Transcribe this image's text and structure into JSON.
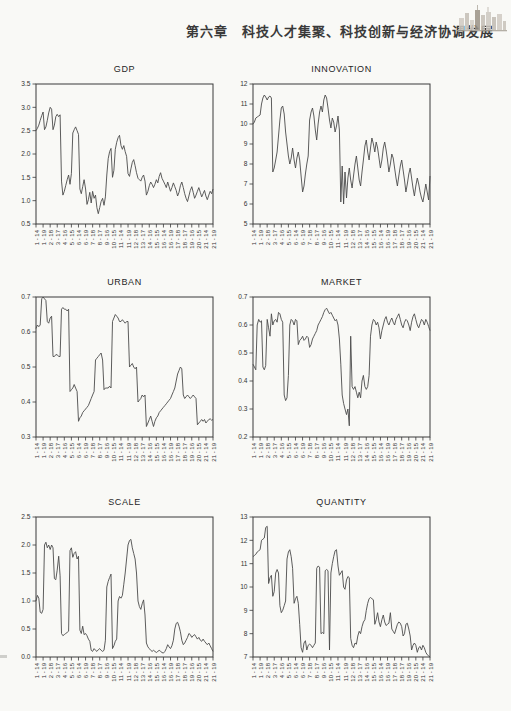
{
  "page": {
    "background": "#f9f9f6",
    "ink": "#4b4b4b"
  },
  "header": {
    "chapter_title": "第六章　科技人才集聚、科技创新与经济协调发展",
    "logo_icon": "city-skyline-icon"
  },
  "chart_data": {
    "type": "line",
    "layout": "2-column 3-row grid of panel-series line charts",
    "grid": "off",
    "legend": "none",
    "x_axis": {
      "n_obs": 126,
      "structure": "21 cross-sections x 6 years (2014-2019), label every 5th observation",
      "labels": [
        "1 - 14",
        "1 - 19",
        "2 - 18",
        "3 - 17",
        "4 - 16",
        "5 - 15",
        "6 - 14",
        "6 - 19",
        "7 - 18",
        "8 - 17",
        "9 - 16",
        "10 - 15",
        "11 - 14",
        "11 - 19",
        "12 - 18",
        "13 - 17",
        "14 - 16",
        "15 - 15",
        "16 - 14",
        "16 - 19",
        "17 - 18",
        "18 - 17",
        "19 - 16",
        "20 - 15",
        "21 - 14",
        "21 - 19"
      ]
    },
    "charts": [
      {
        "title": "GDP",
        "ylim": [
          0.5,
          3.5
        ],
        "ytick_step": 0.5,
        "ytick_decimals": 1,
        "values": [
          2.5,
          2.55,
          2.62,
          2.72,
          2.82,
          2.9,
          2.52,
          2.58,
          2.72,
          2.88,
          3.0,
          2.96,
          2.52,
          2.62,
          2.8,
          2.85,
          2.8,
          2.84,
          1.42,
          1.12,
          1.2,
          1.32,
          1.45,
          1.55,
          1.35,
          1.58,
          2.45,
          2.52,
          2.58,
          2.5,
          2.42,
          1.25,
          1.15,
          1.3,
          1.45,
          1.25,
          0.92,
          1.02,
          1.18,
          0.95,
          1.2,
          1.05,
          1.12,
          0.85,
          0.72,
          0.85,
          0.98,
          1.05,
          0.9,
          1.08,
          1.55,
          1.9,
          2.05,
          2.12,
          1.5,
          1.65,
          2.1,
          2.25,
          2.35,
          2.4,
          2.18,
          2.1,
          2.18,
          2.05,
          1.95,
          1.58,
          1.52,
          1.68,
          1.82,
          1.88,
          1.75,
          1.6,
          1.48,
          1.45,
          1.42,
          1.5,
          1.55,
          1.42,
          1.12,
          1.2,
          1.32,
          1.4,
          1.35,
          1.28,
          1.35,
          1.45,
          1.38,
          1.52,
          1.6,
          1.48,
          1.42,
          1.35,
          1.28,
          1.4,
          1.3,
          1.2,
          1.28,
          1.38,
          1.3,
          1.22,
          1.1,
          1.18,
          1.32,
          1.4,
          1.28,
          1.15,
          1.05,
          0.98,
          1.1,
          1.22,
          1.3,
          1.18,
          1.05,
          1.12,
          1.2,
          1.28,
          1.18,
          1.08,
          1.15,
          1.22,
          1.1,
          1.02,
          1.12,
          1.2,
          1.15,
          1.25
        ]
      },
      {
        "title": "INNOVATION",
        "ylim": [
          5,
          12
        ],
        "ytick_step": 1,
        "ytick_decimals": 0,
        "values": [
          10.0,
          10.1,
          10.3,
          10.35,
          10.4,
          10.45,
          11.0,
          11.3,
          11.45,
          11.35,
          11.2,
          11.35,
          11.4,
          11.3,
          7.6,
          7.8,
          8.2,
          8.6,
          9.4,
          10.2,
          10.8,
          10.9,
          10.5,
          9.6,
          9.0,
          8.4,
          8.0,
          8.3,
          8.8,
          8.2,
          7.8,
          8.3,
          8.6,
          8.2,
          7.4,
          6.6,
          6.9,
          7.5,
          8.0,
          8.4,
          10.2,
          10.6,
          10.8,
          10.4,
          9.7,
          9.2,
          10.0,
          10.6,
          10.9,
          10.6,
          11.2,
          11.45,
          11.3,
          10.8,
          10.2,
          9.8,
          10.3,
          10.1,
          9.6,
          9.9,
          10.4,
          9.7,
          6.1,
          7.9,
          6.0,
          7.6,
          6.3,
          7.3,
          7.8,
          7.2,
          6.8,
          7.4,
          8.0,
          8.4,
          7.8,
          7.2,
          6.9,
          7.6,
          8.2,
          8.9,
          9.2,
          8.6,
          8.2,
          8.8,
          9.3,
          9.0,
          8.6,
          9.1,
          8.8,
          8.3,
          7.8,
          8.2,
          8.8,
          9.1,
          8.7,
          8.2,
          7.6,
          8.0,
          8.5,
          8.3,
          7.8,
          7.3,
          6.9,
          7.4,
          7.9,
          8.2,
          7.7,
          7.2,
          6.6,
          7.0,
          7.5,
          7.8,
          7.3,
          6.8,
          6.4,
          6.9,
          7.3,
          7.0,
          6.6,
          6.3,
          6.1,
          6.5,
          7.0,
          6.6,
          6.2,
          7.4
        ]
      },
      {
        "title": "URBAN",
        "ylim": [
          0.3,
          0.7
        ],
        "ytick_step": 0.1,
        "ytick_decimals": 1,
        "values": [
          0.61,
          0.62,
          0.615,
          0.62,
          0.695,
          0.7,
          0.695,
          0.69,
          0.63,
          0.625,
          0.64,
          0.645,
          0.53,
          0.53,
          0.535,
          0.535,
          0.53,
          0.53,
          0.665,
          0.67,
          0.665,
          0.665,
          0.66,
          0.665,
          0.43,
          0.435,
          0.44,
          0.45,
          0.44,
          0.43,
          0.345,
          0.355,
          0.36,
          0.37,
          0.375,
          0.38,
          0.385,
          0.39,
          0.4,
          0.41,
          0.42,
          0.43,
          0.52,
          0.525,
          0.53,
          0.535,
          0.54,
          0.52,
          0.435,
          0.44,
          0.44,
          0.44,
          0.445,
          0.44,
          0.63,
          0.64,
          0.65,
          0.645,
          0.64,
          0.63,
          0.63,
          0.635,
          0.63,
          0.625,
          0.63,
          0.63,
          0.5,
          0.505,
          0.51,
          0.5,
          0.495,
          0.5,
          0.4,
          0.405,
          0.41,
          0.42,
          0.415,
          0.42,
          0.33,
          0.34,
          0.35,
          0.36,
          0.345,
          0.33,
          0.345,
          0.355,
          0.36,
          0.37,
          0.375,
          0.38,
          0.385,
          0.39,
          0.395,
          0.4,
          0.405,
          0.41,
          0.42,
          0.43,
          0.44,
          0.46,
          0.48,
          0.49,
          0.5,
          0.495,
          0.42,
          0.41,
          0.415,
          0.42,
          0.415,
          0.41,
          0.415,
          0.42,
          0.415,
          0.41,
          0.335,
          0.34,
          0.345,
          0.35,
          0.345,
          0.35,
          0.34,
          0.345,
          0.35,
          0.352,
          0.348,
          0.35
        ]
      },
      {
        "title": "MARKET",
        "ylim": [
          0.2,
          0.7
        ],
        "ytick_step": 0.1,
        "ytick_decimals": 1,
        "values": [
          0.46,
          0.45,
          0.44,
          0.6,
          0.62,
          0.61,
          0.615,
          0.45,
          0.44,
          0.455,
          0.62,
          0.59,
          0.56,
          0.64,
          0.6,
          0.615,
          0.62,
          0.61,
          0.645,
          0.64,
          0.62,
          0.61,
          0.35,
          0.33,
          0.34,
          0.42,
          0.6,
          0.62,
          0.615,
          0.6,
          0.62,
          0.615,
          0.53,
          0.545,
          0.55,
          0.56,
          0.545,
          0.55,
          0.56,
          0.555,
          0.52,
          0.53,
          0.55,
          0.56,
          0.57,
          0.58,
          0.6,
          0.61,
          0.62,
          0.63,
          0.645,
          0.655,
          0.66,
          0.65,
          0.64,
          0.645,
          0.635,
          0.625,
          0.615,
          0.62,
          0.6,
          0.55,
          0.46,
          0.35,
          0.32,
          0.3,
          0.28,
          0.3,
          0.24,
          0.56,
          0.38,
          0.37,
          0.38,
          0.36,
          0.34,
          0.36,
          0.34,
          0.4,
          0.42,
          0.38,
          0.37,
          0.38,
          0.42,
          0.56,
          0.6,
          0.62,
          0.615,
          0.6,
          0.61,
          0.59,
          0.55,
          0.58,
          0.6,
          0.62,
          0.63,
          0.61,
          0.6,
          0.615,
          0.625,
          0.61,
          0.6,
          0.62,
          0.63,
          0.64,
          0.62,
          0.6,
          0.59,
          0.61,
          0.62,
          0.615,
          0.6,
          0.58,
          0.61,
          0.63,
          0.64,
          0.62,
          0.6,
          0.59,
          0.605,
          0.62,
          0.615,
          0.6,
          0.62,
          0.61,
          0.595,
          0.58
        ]
      },
      {
        "title": "SCALE",
        "ylim": [
          0.0,
          2.5
        ],
        "ytick_step": 0.5,
        "ytick_decimals": 1,
        "values": [
          1.0,
          1.1,
          1.05,
          0.8,
          0.78,
          0.85,
          2.0,
          2.05,
          1.95,
          2.0,
          1.92,
          2.0,
          1.95,
          1.4,
          1.38,
          1.55,
          1.8,
          1.45,
          0.42,
          0.38,
          0.4,
          0.42,
          0.44,
          0.46,
          1.9,
          1.95,
          1.78,
          1.85,
          1.88,
          1.75,
          1.8,
          0.48,
          0.42,
          0.55,
          0.4,
          0.42,
          0.38,
          0.32,
          0.28,
          0.12,
          0.1,
          0.15,
          0.12,
          0.1,
          0.13,
          0.15,
          0.12,
          0.1,
          0.12,
          0.3,
          1.25,
          1.35,
          1.42,
          1.48,
          0.15,
          0.2,
          0.28,
          0.32,
          1.0,
          1.08,
          1.05,
          1.1,
          1.3,
          1.5,
          1.75,
          2.0,
          2.08,
          2.1,
          1.95,
          1.85,
          1.75,
          1.5,
          1.0,
          0.9,
          0.85,
          0.95,
          1.02,
          0.75,
          0.25,
          0.18,
          0.15,
          0.12,
          0.1,
          0.12,
          0.1,
          0.08,
          0.1,
          0.12,
          0.1,
          0.08,
          0.07,
          0.1,
          0.15,
          0.22,
          0.18,
          0.15,
          0.2,
          0.3,
          0.5,
          0.6,
          0.62,
          0.55,
          0.45,
          0.3,
          0.22,
          0.25,
          0.3,
          0.35,
          0.42,
          0.4,
          0.35,
          0.38,
          0.4,
          0.36,
          0.32,
          0.35,
          0.3,
          0.28,
          0.32,
          0.28,
          0.25,
          0.22,
          0.25,
          0.2,
          0.15,
          0.1
        ]
      },
      {
        "title": "QUANTITY",
        "ylim": [
          7,
          13
        ],
        "ytick_step": 1,
        "ytick_decimals": 0,
        "values": [
          11.3,
          11.35,
          11.4,
          11.5,
          11.55,
          11.6,
          12.0,
          12.05,
          12.1,
          12.55,
          12.6,
          10.15,
          10.4,
          10.5,
          9.6,
          9.8,
          10.6,
          10.75,
          10.6,
          9.2,
          8.9,
          9.0,
          9.2,
          9.4,
          11.2,
          11.5,
          11.6,
          11.3,
          10.8,
          9.3,
          9.5,
          9.6,
          9.3,
          8.4,
          7.4,
          7.2,
          7.6,
          7.7,
          7.3,
          7.5,
          7.55,
          7.5,
          7.4,
          7.5,
          7.6,
          10.8,
          10.9,
          10.85,
          8.0,
          8.05,
          8.0,
          10.7,
          10.75,
          10.7,
          7.3,
          10.6,
          11.0,
          11.3,
          11.55,
          11.6,
          10.9,
          10.5,
          10.6,
          10.7,
          10.0,
          9.9,
          10.3,
          10.45,
          10.4,
          7.8,
          7.5,
          7.4,
          7.6,
          7.55,
          7.9,
          8.1,
          8.0,
          8.3,
          8.5,
          8.6,
          9.0,
          9.3,
          9.5,
          9.55,
          9.5,
          9.45,
          8.4,
          8.6,
          8.9,
          8.5,
          8.3,
          8.6,
          8.8,
          8.5,
          8.35,
          8.4,
          8.45,
          8.9,
          8.2,
          8.1,
          8.0,
          8.2,
          8.4,
          8.5,
          8.45,
          8.3,
          7.9,
          8.0,
          8.4,
          8.45,
          8.2,
          7.9,
          7.3,
          7.5,
          7.6,
          7.5,
          7.2,
          7.4,
          7.45,
          7.3,
          7.5,
          7.4,
          7.2,
          7.1,
          7.05,
          7.0
        ]
      }
    ]
  }
}
